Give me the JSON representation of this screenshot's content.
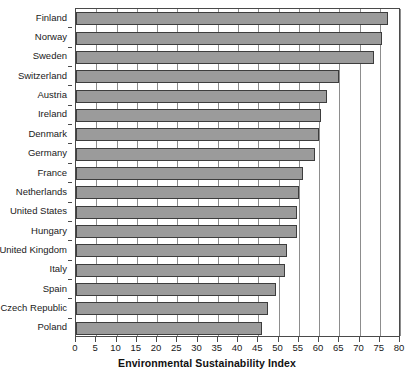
{
  "chart_data": {
    "type": "bar",
    "orientation": "horizontal",
    "title": "",
    "xlabel": "Environmental Sustainability Index",
    "ylabel": "",
    "xlim": [
      0,
      80
    ],
    "ylim": null,
    "grid": true,
    "legend": null,
    "xticks": [
      0,
      5,
      10,
      15,
      20,
      25,
      30,
      35,
      40,
      45,
      50,
      55,
      60,
      65,
      70,
      75,
      80
    ],
    "categories": [
      "Finland",
      "Norway",
      "Sweden",
      "Switzerland",
      "Austria",
      "Ireland",
      "Denmark",
      "Germany",
      "France",
      "Netherlands",
      "United States",
      "Hungary",
      "United Kingdom",
      "Italy",
      "Spain",
      "Czech Republic",
      "Poland"
    ],
    "values": [
      77.0,
      75.5,
      73.5,
      65.0,
      62.0,
      60.5,
      60.0,
      59.0,
      56.0,
      55.0,
      54.5,
      54.5,
      52.0,
      51.5,
      49.5,
      47.5,
      46.0
    ],
    "bar_color": "#9b9b9b",
    "bar_edge_color": "#3d3d3d",
    "grid_color": "#8d8d8d",
    "axis_color": "#4a4a4a",
    "text_color": "#1a1a1a"
  }
}
